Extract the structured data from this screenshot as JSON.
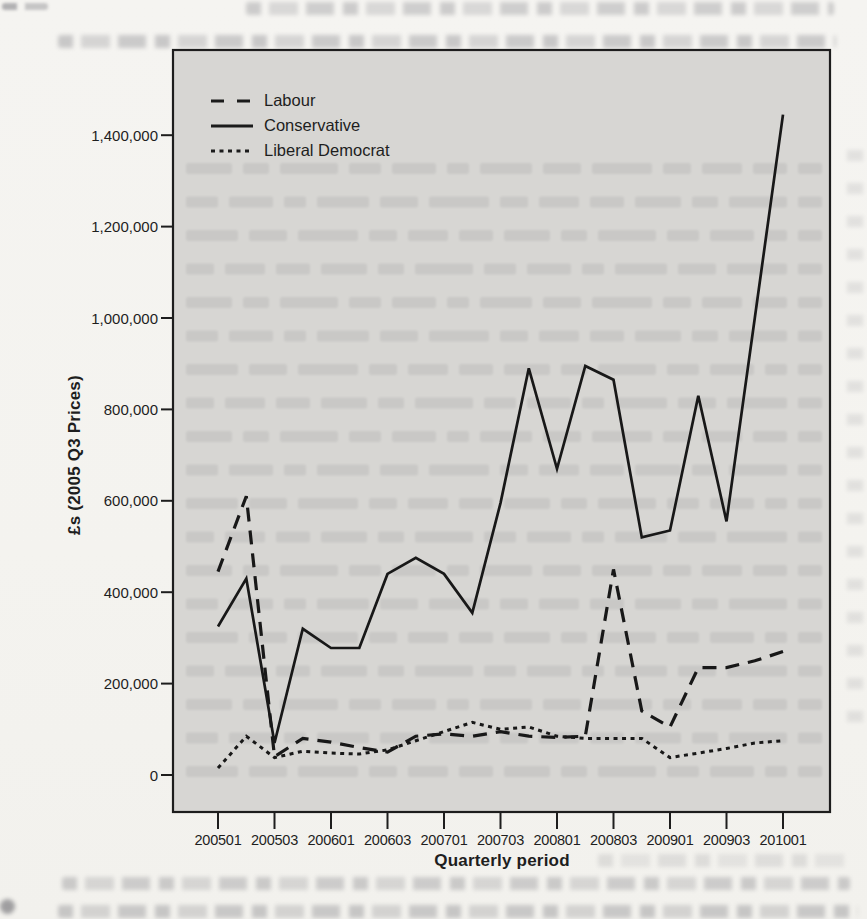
{
  "chart_data": {
    "type": "line",
    "title": "",
    "xlabel": "Quarterly period",
    "ylabel": "£s (2005 Q3 Prices)",
    "grid": false,
    "legend_position": "top-left",
    "plot_background": "#d7d6d3",
    "line_color": "#181818",
    "x_axis": {
      "tick_labels": [
        "200501",
        "200503",
        "200601",
        "200603",
        "200701",
        "200703",
        "200801",
        "200803",
        "200901",
        "200903",
        "201001"
      ]
    },
    "y_axis": {
      "tick_labels": [
        "0",
        "200,000",
        "400,000",
        "600,000",
        "800,000",
        "1,000,000",
        "1,200,000",
        "1,400,000"
      ],
      "tick_values": [
        0,
        200000,
        400000,
        600000,
        800000,
        1000000,
        1200000,
        1400000
      ],
      "range": [
        0,
        1500000
      ]
    },
    "categories": [
      "200501",
      "200502",
      "200503",
      "200504",
      "200601",
      "200602",
      "200603",
      "200604",
      "200701",
      "200702",
      "200703",
      "200704",
      "200801",
      "200802",
      "200803",
      "200804",
      "200901",
      "200902",
      "200903",
      "200904",
      "201001"
    ],
    "series": [
      {
        "name": "Labour",
        "line_style": "long-dash",
        "values": [
          445000,
          610000,
          40000,
          80000,
          72000,
          60000,
          50000,
          85000,
          90000,
          85000,
          95000,
          85000,
          82000,
          85000,
          450000,
          140000,
          105000,
          235000,
          235000,
          250000,
          270000
        ]
      },
      {
        "name": "Conservative",
        "line_style": "solid",
        "values": [
          325000,
          430000,
          70000,
          320000,
          278000,
          278000,
          440000,
          475000,
          440000,
          355000,
          595000,
          890000,
          670000,
          895000,
          865000,
          520000,
          535000,
          830000,
          555000,
          1000000,
          1445000
        ]
      },
      {
        "name": "Liberal Democrat",
        "line_style": "short-dash",
        "values": [
          15000,
          85000,
          38000,
          52000,
          48000,
          46000,
          55000,
          75000,
          95000,
          115000,
          100000,
          105000,
          85000,
          80000,
          80000,
          80000,
          38000,
          48000,
          58000,
          70000,
          75000
        ]
      }
    ]
  }
}
